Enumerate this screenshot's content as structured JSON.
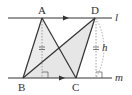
{
  "diagram": {
    "points": {
      "A": {
        "label": "A",
        "x": 42,
        "y": 18
      },
      "B": {
        "label": "B",
        "x": 23,
        "y": 78
      },
      "C": {
        "label": "C",
        "x": 76,
        "y": 78
      },
      "D": {
        "label": "D",
        "x": 95,
        "y": 18
      }
    },
    "lines": {
      "l": {
        "label": "l"
      },
      "m": {
        "label": "m"
      }
    },
    "height_label": "h",
    "colors": {
      "stroke": "#333333",
      "shade": "#e6e6e6",
      "dashed": "#888888"
    }
  }
}
